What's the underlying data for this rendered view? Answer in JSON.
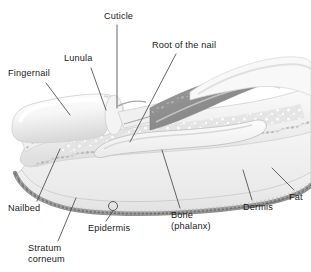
{
  "figure": {
    "background_color": "#ffffff",
    "text_color": "#1a1a1a",
    "leader_color": "#4a4a4a",
    "width": 311,
    "height": 272
  },
  "labels": [
    {
      "id": "fingernail",
      "text": "Fingernail",
      "x": 8,
      "y": 68,
      "leader": {
        "x1": 46,
        "y1": 83,
        "x2": 70,
        "y2": 115
      }
    },
    {
      "id": "lunula",
      "text": "Lunula",
      "x": 64,
      "y": 53,
      "leader": {
        "x1": 91,
        "y1": 68,
        "x2": 106,
        "y2": 110
      }
    },
    {
      "id": "cuticle",
      "text": "Cuticle",
      "x": 104,
      "y": 11,
      "leader": {
        "x1": 117,
        "y1": 25,
        "x2": 117,
        "y2": 108
      }
    },
    {
      "id": "root-of-the-nail",
      "text": "Root of the nail",
      "x": 152,
      "y": 40,
      "leader": {
        "x1": 176,
        "y1": 54,
        "x2": 130,
        "y2": 142
      }
    },
    {
      "id": "fat",
      "text": "Fat",
      "x": 289,
      "y": 192,
      "leader": {
        "x1": 294,
        "y1": 190,
        "x2": 272,
        "y2": 168
      }
    },
    {
      "id": "dermis",
      "text": "Dermis",
      "x": 243,
      "y": 202,
      "leader": {
        "x1": 252,
        "y1": 200,
        "x2": 243,
        "y2": 170
      }
    },
    {
      "id": "bone-phalanx",
      "text": "Bone\n(phalanx)",
      "x": 171,
      "y": 210,
      "leader": {
        "x1": 180,
        "y1": 208,
        "x2": 162,
        "y2": 150
      }
    },
    {
      "id": "epidermis",
      "text": "Epidermis",
      "x": 88,
      "y": 223,
      "leader": {
        "x1": 106,
        "y1": 221,
        "x2": 113,
        "y2": 211
      },
      "marker": {
        "cx": 113,
        "cy": 206,
        "r": 4.5
      }
    },
    {
      "id": "stratum-corneum",
      "text": "Stratum\ncorneum",
      "x": 28,
      "y": 243,
      "leader": {
        "x1": 58,
        "y1": 241,
        "x2": 76,
        "y2": 198
      }
    },
    {
      "id": "nailbed",
      "text": "Nailbed",
      "x": 8,
      "y": 203,
      "leader": {
        "x1": 37,
        "y1": 201,
        "x2": 60,
        "y2": 149
      }
    }
  ]
}
